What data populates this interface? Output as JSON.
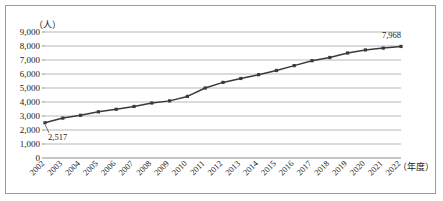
{
  "chart_data": {
    "type": "line",
    "title": "",
    "xlabel": "（年度）",
    "ylabel": "（人）",
    "ylim": [
      0,
      9000
    ],
    "y_ticks": [
      "0",
      "1,000",
      "2,000",
      "3,000",
      "4,000",
      "5,000",
      "6,000",
      "7,000",
      "8,000",
      "9,000"
    ],
    "y_tick_values": [
      0,
      1000,
      2000,
      3000,
      4000,
      5000,
      6000,
      7000,
      8000,
      9000
    ],
    "grid": true,
    "legend": "none",
    "categories": [
      "2002",
      "2003",
      "2004",
      "2005",
      "2006",
      "2007",
      "2008",
      "2009",
      "2010",
      "2011",
      "2012",
      "2013",
      "2014",
      "2015",
      "2016",
      "2017",
      "2018",
      "2019",
      "2020",
      "2021",
      "2022"
    ],
    "values": [
      2517,
      2850,
      3050,
      3300,
      3480,
      3680,
      3930,
      4080,
      4400,
      5000,
      5400,
      5680,
      5950,
      6250,
      6600,
      6950,
      7180,
      7500,
      7720,
      7850,
      7968
    ],
    "annotations": [
      {
        "category": "2002",
        "value": 2517,
        "text": "2,517"
      },
      {
        "category": "2022",
        "value": 7968,
        "text": "7,968"
      }
    ],
    "marker": "square",
    "series_color": "#3a3a3a",
    "grid_color": "#a6a6a6"
  }
}
